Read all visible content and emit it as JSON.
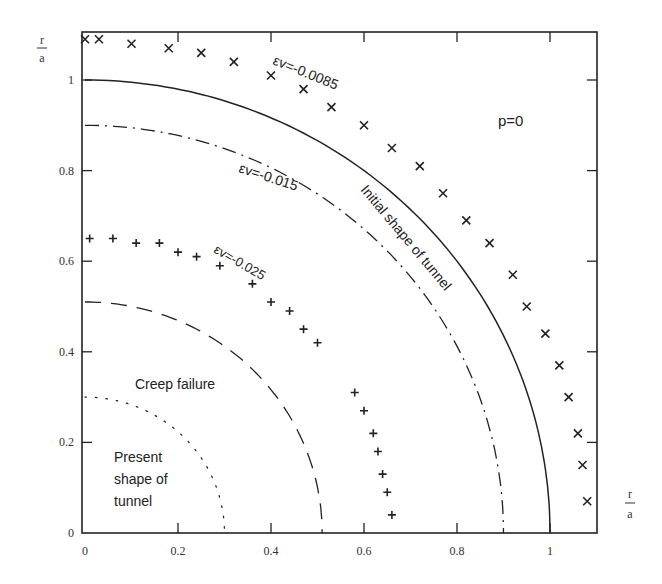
{
  "chart_data": {
    "type": "scatter",
    "title": "",
    "annotation_param": "p=0",
    "xlabel": {
      "numerator": "r",
      "denominator": "a"
    },
    "ylabel": {
      "numerator": "r",
      "denominator": "a"
    },
    "xlim": [
      0,
      1.1
    ],
    "ylim": [
      0,
      1.105
    ],
    "x_ticks": [
      0,
      0.2,
      0.4,
      0.6,
      0.8,
      1
    ],
    "x_tick_labels": [
      "0",
      "0.2",
      "0.4",
      "0.6",
      "0.8",
      "1"
    ],
    "y_ticks": [
      0,
      0.2,
      0.4,
      0.6,
      0.8,
      1
    ],
    "y_tick_labels": [
      "0",
      "0.2",
      "0.4",
      "0.6",
      "0.8",
      "1"
    ],
    "grid": false,
    "legend": "none (inline labels)",
    "series": [
      {
        "name": "εv=-0.0085",
        "marker": "x",
        "points": [
          [
            0,
            1.09
          ],
          [
            0.03,
            1.09
          ],
          [
            0.1,
            1.08
          ],
          [
            0.18,
            1.07
          ],
          [
            0.25,
            1.06
          ],
          [
            0.32,
            1.04
          ],
          [
            0.4,
            1.01
          ],
          [
            0.47,
            0.98
          ],
          [
            0.53,
            0.94
          ],
          [
            0.6,
            0.9
          ],
          [
            0.66,
            0.85
          ],
          [
            0.72,
            0.81
          ],
          [
            0.77,
            0.75
          ],
          [
            0.82,
            0.69
          ],
          [
            0.87,
            0.64
          ],
          [
            0.92,
            0.57
          ],
          [
            0.95,
            0.5
          ],
          [
            0.99,
            0.44
          ],
          [
            1.02,
            0.37
          ],
          [
            1.04,
            0.3
          ],
          [
            1.06,
            0.22
          ],
          [
            1.07,
            0.15
          ],
          [
            1.08,
            0.07
          ]
        ]
      },
      {
        "name": "Initial shape of tunnel",
        "line": "solid",
        "radius": 1.0
      },
      {
        "name": "εv=-0.015",
        "line": "dash-dot",
        "radius": 0.9
      },
      {
        "name": "εv=-0.025",
        "marker": "+",
        "points": [
          [
            0.01,
            0.65
          ],
          [
            0.06,
            0.65
          ],
          [
            0.11,
            0.64
          ],
          [
            0.16,
            0.64
          ],
          [
            0.2,
            0.62
          ],
          [
            0.24,
            0.61
          ],
          [
            0.29,
            0.59
          ],
          [
            0.36,
            0.55
          ],
          [
            0.4,
            0.51
          ],
          [
            0.44,
            0.49
          ],
          [
            0.47,
            0.45
          ],
          [
            0.5,
            0.42
          ],
          [
            0.58,
            0.31
          ],
          [
            0.6,
            0.27
          ],
          [
            0.62,
            0.22
          ],
          [
            0.63,
            0.18
          ],
          [
            0.64,
            0.13
          ],
          [
            0.65,
            0.09
          ],
          [
            0.66,
            0.04
          ]
        ]
      },
      {
        "name": "Creep failure",
        "line": "dashed",
        "radius": 0.51
      },
      {
        "name": "Present shape of tunnel",
        "line": "dotted",
        "radius": 0.3
      }
    ]
  },
  "labels": {
    "p": "p=0",
    "ev_0085": "εv=-0.0085",
    "ev_015": "εv=-0.015",
    "ev_025": "εv=-0.025",
    "initial": "Initial shape of tunnel",
    "creep": "Creep failure",
    "present_1": "Present",
    "present_2": "shape of",
    "present_3": "tunnel",
    "axis_r": "r",
    "axis_a": "a"
  }
}
